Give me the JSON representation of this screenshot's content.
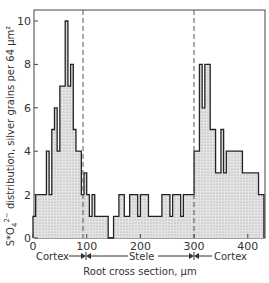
{
  "chart_data": {
    "type": "bar",
    "subtype": "histogram",
    "title": "",
    "xlabel": "Root cross section, μm",
    "ylabel": "S*O4 2- distribution, silver grains per 64 μm²",
    "xlim": [
      0,
      430
    ],
    "ylim": [
      0,
      10.5
    ],
    "xticks": [
      0,
      100,
      200,
      300,
      400
    ],
    "yticks": [
      0,
      2,
      4,
      6,
      8,
      10
    ],
    "grid": false,
    "bin_width": 10,
    "bins_start": [
      0,
      10,
      20,
      30,
      40,
      50,
      60,
      70,
      80,
      90,
      100,
      110,
      120,
      130,
      140,
      150,
      160,
      170,
      180,
      190,
      200,
      210,
      220,
      230,
      240,
      250,
      260,
      270,
      280,
      290,
      300,
      310,
      320,
      330,
      340,
      350,
      360,
      370,
      380,
      390,
      400,
      410,
      420
    ],
    "values": [
      1,
      2,
      2,
      2,
      4,
      2,
      5,
      6,
      4,
      7,
      10,
      7,
      8,
      5,
      4,
      2,
      3,
      2,
      1,
      2,
      1,
      1,
      0,
      0,
      1,
      1,
      1,
      2,
      2,
      1,
      1,
      2,
      2,
      1,
      2,
      2,
      1,
      2,
      4,
      8,
      6,
      8,
      5,
      3,
      3,
      4,
      3,
      3,
      3,
      3,
      3,
      2.5,
      1
    ],
    "bins": [
      {
        "x0": 0,
        "x1": 5,
        "y": 1
      },
      {
        "x0": 5,
        "x1": 25,
        "y": 2
      },
      {
        "x0": 25,
        "x1": 30,
        "y": 4
      },
      {
        "x0": 30,
        "x1": 35,
        "y": 2
      },
      {
        "x0": 35,
        "x1": 40,
        "y": 5
      },
      {
        "x0": 40,
        "x1": 45,
        "y": 6
      },
      {
        "x0": 45,
        "x1": 50,
        "y": 4
      },
      {
        "x0": 50,
        "x1": 60,
        "y": 7
      },
      {
        "x0": 60,
        "x1": 65,
        "y": 10
      },
      {
        "x0": 65,
        "x1": 70,
        "y": 7
      },
      {
        "x0": 70,
        "x1": 75,
        "y": 8
      },
      {
        "x0": 75,
        "x1": 80,
        "y": 5
      },
      {
        "x0": 80,
        "x1": 90,
        "y": 4
      },
      {
        "x0": 90,
        "x1": 95,
        "y": 2
      },
      {
        "x0": 95,
        "x1": 100,
        "y": 3
      },
      {
        "x0": 100,
        "x1": 105,
        "y": 2
      },
      {
        "x0": 105,
        "x1": 110,
        "y": 1
      },
      {
        "x0": 110,
        "x1": 115,
        "y": 2
      },
      {
        "x0": 115,
        "x1": 125,
        "y": 1
      },
      {
        "x0": 125,
        "x1": 140,
        "y": 1
      },
      {
        "x0": 140,
        "x1": 150,
        "y": 0
      },
      {
        "x0": 150,
        "x1": 160,
        "y": 1
      },
      {
        "x0": 160,
        "x1": 170,
        "y": 2
      },
      {
        "x0": 170,
        "x1": 180,
        "y": 1
      },
      {
        "x0": 180,
        "x1": 195,
        "y": 2
      },
      {
        "x0": 195,
        "x1": 200,
        "y": 1
      },
      {
        "x0": 200,
        "x1": 215,
        "y": 2
      },
      {
        "x0": 215,
        "x1": 220,
        "y": 1
      },
      {
        "x0": 220,
        "x1": 240,
        "y": 1
      },
      {
        "x0": 240,
        "x1": 255,
        "y": 2
      },
      {
        "x0": 255,
        "x1": 260,
        "y": 1
      },
      {
        "x0": 260,
        "x1": 275,
        "y": 2
      },
      {
        "x0": 275,
        "x1": 280,
        "y": 1
      },
      {
        "x0": 280,
        "x1": 290,
        "y": 2
      },
      {
        "x0": 290,
        "x1": 300,
        "y": 2
      },
      {
        "x0": 300,
        "x1": 310,
        "y": 4
      },
      {
        "x0": 310,
        "x1": 315,
        "y": 8
      },
      {
        "x0": 315,
        "x1": 320,
        "y": 6
      },
      {
        "x0": 320,
        "x1": 330,
        "y": 8
      },
      {
        "x0": 330,
        "x1": 340,
        "y": 5
      },
      {
        "x0": 340,
        "x1": 350,
        "y": 3
      },
      {
        "x0": 350,
        "x1": 355,
        "y": 5
      },
      {
        "x0": 355,
        "x1": 360,
        "y": 3
      },
      {
        "x0": 360,
        "x1": 390,
        "y": 4
      },
      {
        "x0": 390,
        "x1": 395,
        "y": 3
      },
      {
        "x0": 395,
        "x1": 400,
        "y": 3
      },
      {
        "x0": 400,
        "x1": 415,
        "y": 3
      },
      {
        "x0": 415,
        "x1": 420,
        "y": 3
      },
      {
        "x0": 420,
        "x1": 430,
        "y": 2
      }
    ],
    "annotations": [
      {
        "type": "vline",
        "x": 90,
        "style": "dashed"
      },
      {
        "type": "vline",
        "x": 300,
        "style": "dashed"
      },
      {
        "type": "region_label",
        "text": "Cortex",
        "x_range": [
          0,
          90
        ]
      },
      {
        "type": "region_label",
        "text": "Stele",
        "x_range": [
          90,
          300
        ]
      },
      {
        "type": "region_label",
        "text": "Cortex",
        "x_range": [
          300,
          430
        ]
      }
    ]
  },
  "axes": {
    "x_ticks": [
      "0",
      "100",
      "200",
      "300",
      "400"
    ],
    "y_ticks": [
      "0",
      "2",
      "4",
      "6",
      "8",
      "10"
    ],
    "x_label": "Root cross section,  μm",
    "y_label_main": "S*O",
    "y_label_rest": " distribution, silver grains per 64 μm²"
  },
  "regions": {
    "left": "Cortex",
    "middle": "Stele",
    "right": "Cortex"
  }
}
